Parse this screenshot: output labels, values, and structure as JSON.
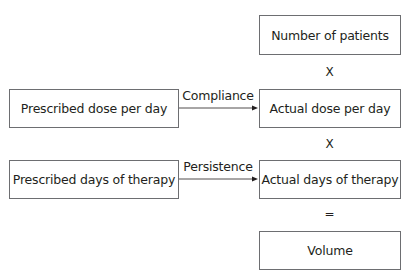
{
  "diagram": {
    "nodes": {
      "patients": "Number of patients",
      "actual_dose": "Actual dose per day",
      "prescribed_dose": "Prescribed dose per day",
      "prescribed_days": "Prescribed days of therapy",
      "actual_days": "Actual days of therapy",
      "volume": "Volume"
    },
    "operators": {
      "multiply_1": "X",
      "multiply_2": "X",
      "equals": "="
    },
    "edges": [
      {
        "from": "prescribed_dose",
        "to": "actual_dose",
        "label": "Compliance"
      },
      {
        "from": "prescribed_days",
        "to": "actual_days",
        "label": "Persistence"
      }
    ],
    "colors": {
      "border": "#6d6e71",
      "text": "#231f20",
      "arrow": "#231f20"
    }
  }
}
